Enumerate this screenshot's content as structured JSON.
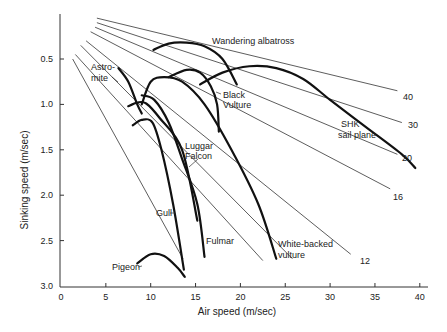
{
  "chart_data": {
    "type": "line",
    "title": "",
    "xlabel": "Air speed (m/sec)",
    "ylabel": "Sinking speed (m/sec)",
    "xlim": [
      0,
      40
    ],
    "ylim": [
      3.0,
      0
    ],
    "y_inverted": true,
    "x_ticks": [
      "0",
      "5",
      "10",
      "15",
      "20",
      "25",
      "30",
      "35",
      "40"
    ],
    "y_ticks": [
      "0.5",
      "1.0",
      "1.5",
      "2.0",
      "2.5",
      "3.0"
    ],
    "grid": false,
    "glide_ratio_lines": [
      {
        "label": "40",
        "x1": 4,
        "y1": 0.05,
        "x2": 37.5,
        "y2": 0.85
      },
      {
        "label": "30",
        "x1": 4,
        "y1": 0.1,
        "x2": 38,
        "y2": 1.2
      },
      {
        "label": "20",
        "x1": 3.8,
        "y1": 0.15,
        "x2": 37.5,
        "y2": 1.55
      },
      {
        "label": "16",
        "x1": 3.3,
        "y1": 0.2,
        "x2": 36.7,
        "y2": 1.93
      },
      {
        "label": "12",
        "x1": 2.8,
        "y1": 0.3,
        "x2": 32.3,
        "y2": 2.65
      },
      {
        "label": "",
        "x1": 2.2,
        "y1": 0.35,
        "x2": 25.8,
        "y2": 2.7
      },
      {
        "label": "",
        "x1": 1.6,
        "y1": 0.45,
        "x2": 22.5,
        "y2": 2.72
      },
      {
        "label": "",
        "x1": 1.3,
        "y1": 0.5,
        "x2": 13.6,
        "y2": 2.7
      }
    ],
    "series": [
      {
        "name": "Wandering albatross",
        "points": [
          [
            10.3,
            0.4
          ],
          [
            12,
            0.33
          ],
          [
            14,
            0.32
          ],
          [
            16,
            0.36
          ],
          [
            18,
            0.5
          ],
          [
            19.6,
            0.78
          ]
        ]
      },
      {
        "name": "SHK sail plane",
        "points": [
          [
            15.5,
            0.78
          ],
          [
            18,
            0.65
          ],
          [
            21,
            0.58
          ],
          [
            24,
            0.6
          ],
          [
            27,
            0.72
          ],
          [
            30,
            0.95
          ],
          [
            34,
            1.25
          ],
          [
            38,
            1.55
          ],
          [
            39.5,
            1.7
          ]
        ]
      },
      {
        "name": "Black Vulture",
        "points": [
          [
            12,
            0.7
          ],
          [
            14,
            0.62
          ],
          [
            15.5,
            0.65
          ],
          [
            16.7,
            0.8
          ],
          [
            17.4,
            1.0
          ],
          [
            17.6,
            1.3
          ]
        ]
      },
      {
        "name": "Astromite",
        "points": [
          [
            6.4,
            0.6
          ],
          [
            7.5,
            0.75
          ],
          [
            8.5,
            1.0
          ],
          [
            9,
            1.1
          ]
        ]
      },
      {
        "name": "White-backed vulture",
        "points": [
          [
            9,
            1.0
          ],
          [
            10,
            0.75
          ],
          [
            11.5,
            0.7
          ],
          [
            13.5,
            0.75
          ],
          [
            16,
            1.0
          ],
          [
            19,
            1.5
          ],
          [
            22,
            2.1
          ],
          [
            24,
            2.7
          ]
        ]
      },
      {
        "name": "Luggar Falcon",
        "points": [
          [
            7.5,
            1.02
          ],
          [
            8.5,
            0.98
          ],
          [
            9.5,
            0.99
          ],
          [
            11,
            1.15
          ],
          [
            13.5,
            1.5
          ],
          [
            15.2,
            2.28
          ]
        ]
      },
      {
        "name": "Fulmar",
        "points": [
          [
            9,
            0.9
          ],
          [
            10.4,
            0.95
          ],
          [
            12,
            1.2
          ],
          [
            13.5,
            1.6
          ],
          [
            15.2,
            2.1
          ],
          [
            16,
            2.68
          ]
        ]
      },
      {
        "name": "Gull",
        "points": [
          [
            8,
            1.23
          ],
          [
            9,
            1.17
          ],
          [
            10.2,
            1.2
          ],
          [
            11.2,
            1.5
          ],
          [
            12.5,
            2.1
          ],
          [
            13.7,
            2.82
          ]
        ]
      },
      {
        "name": "Pigeon",
        "points": [
          [
            8.5,
            2.75
          ],
          [
            10,
            2.65
          ],
          [
            11.5,
            2.67
          ],
          [
            13,
            2.8
          ],
          [
            13.8,
            2.9
          ]
        ]
      }
    ],
    "annotations": [
      "Wandering albatross",
      "Astro-mite",
      "Black Vulture",
      "Luggar Falcon",
      "SHK sail plane",
      "Gull",
      "Fulmar",
      "White-backed vulture",
      "Pigeon",
      "40",
      "30",
      "20",
      "16",
      "12"
    ]
  },
  "labels": {
    "xlabel": "Air speed (m/sec)",
    "ylabel": "Sinking speed (m/sec)",
    "albatross": "Wandering albatross",
    "astro1": "Astro-",
    "astro2": "mite",
    "black1": "Black",
    "black2": "Vulture",
    "luggar1": "Luggar",
    "luggar2": "Falcon",
    "shk1": "SHK",
    "shk2": "sail plane",
    "gull": "Gull",
    "fulmar": "Fulmar",
    "wbv1": "White-backed",
    "wbv2": "vulture",
    "pigeon": "Pigeon",
    "r40": "40",
    "r30": "30",
    "r20": "20",
    "r16": "16",
    "r12": "12"
  }
}
